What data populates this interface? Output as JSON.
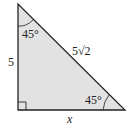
{
  "diagram": {
    "type": "right-triangle",
    "colors": {
      "fill": "#e2e2e2",
      "stroke": "#222222",
      "background": "#ffffff"
    },
    "labels": {
      "left_side": "5",
      "hypotenuse": "5√2",
      "bottom_side": "x",
      "top_angle": "45°",
      "bottom_right_angle": "45°"
    },
    "right_angle_marker": "bottom-left"
  }
}
